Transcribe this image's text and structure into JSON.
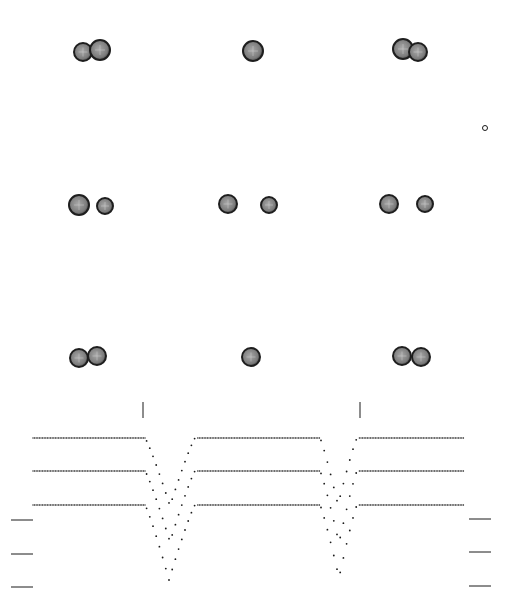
{
  "figure": {
    "width": 513,
    "height": 608,
    "background": "#ffffff",
    "ink": "#1a1a1a",
    "star_fill": "#8a8a8a",
    "star_edge": "#1e1e1e"
  },
  "binary_panels": [
    {
      "row": 0,
      "col": 0,
      "stars": [
        {
          "cx": 83,
          "cy": 52,
          "r": 9
        },
        {
          "cx": 100,
          "cy": 50,
          "r": 10
        }
      ]
    },
    {
      "row": 0,
      "col": 1,
      "stars": [
        {
          "cx": 253,
          "cy": 51,
          "r": 10
        }
      ]
    },
    {
      "row": 0,
      "col": 2,
      "stars": [
        {
          "cx": 403,
          "cy": 49,
          "r": 10
        },
        {
          "cx": 418,
          "cy": 52,
          "r": 9
        }
      ]
    },
    {
      "row": 1,
      "col": 0,
      "stars": [
        {
          "cx": 79,
          "cy": 205,
          "r": 10
        },
        {
          "cx": 105,
          "cy": 206,
          "r": 8
        }
      ]
    },
    {
      "row": 1,
      "col": 1,
      "stars": [
        {
          "cx": 228,
          "cy": 204,
          "r": 9
        },
        {
          "cx": 269,
          "cy": 205,
          "r": 8
        }
      ]
    },
    {
      "row": 1,
      "col": 2,
      "stars": [
        {
          "cx": 389,
          "cy": 204,
          "r": 9
        },
        {
          "cx": 425,
          "cy": 204,
          "r": 8
        }
      ]
    },
    {
      "row": 2,
      "col": 0,
      "stars": [
        {
          "cx": 79,
          "cy": 358,
          "r": 9
        },
        {
          "cx": 97,
          "cy": 356,
          "r": 9
        }
      ]
    },
    {
      "row": 2,
      "col": 1,
      "stars": [
        {
          "cx": 251,
          "cy": 357,
          "r": 9
        }
      ]
    },
    {
      "row": 2,
      "col": 2,
      "stars": [
        {
          "cx": 402,
          "cy": 356,
          "r": 9
        },
        {
          "cx": 421,
          "cy": 357,
          "r": 9
        }
      ]
    }
  ],
  "marker": {
    "shape": "small-open-circle",
    "cx": 485,
    "cy": 128,
    "r": 2.5
  },
  "chart_data": {
    "type": "scatter",
    "title": "",
    "xlabel": "",
    "ylabel": "",
    "grid": false,
    "legend": null,
    "phase_ticks_x": [
      143,
      360
    ],
    "phase_tick_y": [
      402,
      418
    ],
    "x_range_px": [
      33,
      465
    ],
    "series": [
      {
        "name": "curve-1",
        "baseline_y": 438,
        "eclipses": [
          {
            "ingress_x": 145,
            "egress_x": 195,
            "min_x": 170,
            "min_y": 506
          },
          {
            "ingress_x": 320,
            "egress_x": 357,
            "min_x": 338,
            "min_y": 505
          }
        ]
      },
      {
        "name": "curve-2",
        "baseline_y": 471,
        "eclipses": [
          {
            "ingress_x": 145,
            "egress_x": 195,
            "min_x": 170,
            "min_y": 542
          },
          {
            "ingress_x": 320,
            "egress_x": 357,
            "min_x": 339,
            "min_y": 543
          }
        ]
      },
      {
        "name": "curve-3",
        "baseline_y": 505,
        "eclipses": [
          {
            "ingress_x": 145,
            "egress_x": 195,
            "min_x": 169,
            "min_y": 580
          },
          {
            "ingress_x": 320,
            "egress_x": 357,
            "min_x": 339,
            "min_y": 578
          }
        ]
      }
    ],
    "reference_bars": {
      "left": {
        "x1": 11,
        "x2": 33,
        "y": [
          520,
          554,
          587
        ]
      },
      "right": {
        "x1": 469,
        "x2": 491,
        "y": [
          519,
          552,
          586
        ]
      }
    }
  }
}
